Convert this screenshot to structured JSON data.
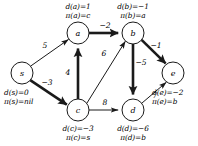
{
  "figure": {
    "type": "directed-weighted-graph"
  },
  "nodes": [
    {
      "id": "s",
      "label": "s",
      "cx": 22,
      "cy": 73,
      "r": 11
    },
    {
      "id": "a",
      "label": "a",
      "cx": 78,
      "cy": 33,
      "r": 11
    },
    {
      "id": "b",
      "label": "b",
      "cx": 133,
      "cy": 33,
      "r": 11
    },
    {
      "id": "c",
      "label": "c",
      "cx": 78,
      "cy": 110,
      "r": 11
    },
    {
      "id": "d",
      "label": "d",
      "cx": 133,
      "cy": 110,
      "r": 11
    },
    {
      "id": "e",
      "label": "e",
      "cx": 173,
      "cy": 73,
      "r": 11
    }
  ],
  "edges": [
    {
      "from": "s",
      "to": "a",
      "weight": "5",
      "tree": false,
      "lx": 45,
      "ly": 45
    },
    {
      "from": "s",
      "to": "c",
      "weight": "−3",
      "tree": true,
      "lx": 47,
      "ly": 82
    },
    {
      "from": "a",
      "to": "b",
      "weight": "−2",
      "tree": true,
      "lx": 105,
      "ly": 25
    },
    {
      "from": "c",
      "to": "a",
      "weight": "4",
      "tree": true,
      "lx": 68,
      "ly": 72
    },
    {
      "from": "c",
      "to": "b",
      "weight": "6",
      "tree": false,
      "lx": 104,
      "ly": 53
    },
    {
      "from": "b",
      "to": "d",
      "weight": "−5",
      "tree": true,
      "lx": 141,
      "ly": 62
    },
    {
      "from": "b",
      "to": "e",
      "weight": "−1",
      "tree": true,
      "lx": 156,
      "ly": 45
    },
    {
      "from": "c",
      "to": "d",
      "weight": "8",
      "tree": false,
      "lx": 105,
      "ly": 102
    },
    {
      "from": "d",
      "to": "e",
      "weight": "7",
      "tree": false,
      "lx": 155,
      "ly": 95
    }
  ],
  "annotations": [
    {
      "node": "s",
      "d": "d(s)=0",
      "pi": "π(s)=nil",
      "x": 4,
      "y": 88,
      "align": "left"
    },
    {
      "node": "a",
      "d": "d(a)=1",
      "pi": "π(a)=c",
      "x": 78,
      "y": 2,
      "align": "center"
    },
    {
      "node": "b",
      "d": "d(b)=−1",
      "pi": "π(b)=a",
      "x": 133,
      "y": 2,
      "align": "center"
    },
    {
      "node": "c",
      "d": "d(c)=−3",
      "pi": "π(c)=s",
      "x": 78,
      "y": 124,
      "align": "center"
    },
    {
      "node": "d",
      "d": "d(d)=−6",
      "pi": "π(d)=b",
      "x": 133,
      "y": 124,
      "align": "center"
    },
    {
      "node": "e",
      "d": "d(e)=−2",
      "pi": "π(e)=b",
      "x": 152,
      "y": 88,
      "align": "left"
    }
  ],
  "style": {
    "stroke": "#1a1a1a",
    "node_fill": "#ffffff",
    "thin_width": 1.0,
    "thick_width": 2.6
  }
}
